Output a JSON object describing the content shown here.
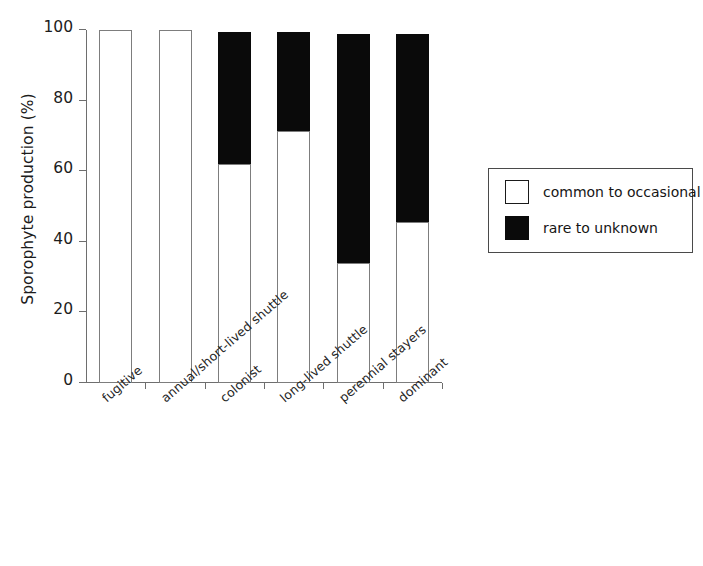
{
  "chart_data": {
    "type": "bar",
    "subtype": "stacked-bar-vertical-100",
    "title": "",
    "xlabel": "",
    "ylabel": "Sporophyte production (%)",
    "ylim": [
      0,
      100
    ],
    "yticks": [
      0,
      20,
      40,
      60,
      80,
      100
    ],
    "ytick_labels": [
      "0",
      "20",
      "40",
      "60",
      "80",
      "100"
    ],
    "grid": false,
    "legend_position": "right",
    "categories": [
      "fugitive",
      "annual/short-lived shuttle",
      "colonist",
      "long-lived shuttle",
      "perennial stayers",
      "dominant"
    ],
    "series": [
      {
        "name": "common to occasional",
        "color": "#ffffff",
        "edge_color": "#7d7d7d",
        "values": [
          100,
          100,
          62,
          71.5,
          34,
          45.5
        ]
      },
      {
        "name": "rare to unknown",
        "color": "#0a0a0a",
        "edge_color": "#0a0a0a",
        "values": [
          0,
          0,
          37.5,
          28,
          65,
          53.5
        ]
      }
    ],
    "bar_totals": [
      100,
      100,
      99.5,
      99.5,
      99,
      99
    ]
  },
  "axes": {
    "y_title": "Sporophyte production (%)",
    "y_tick_labels": [
      "100",
      "80",
      "60",
      "40",
      "20",
      "0"
    ]
  },
  "legend": {
    "entries": [
      {
        "label": "common to occasional",
        "swatch": "white-square-swatch"
      },
      {
        "label": "rare to unknown",
        "swatch": "black-square-swatch"
      }
    ]
  }
}
